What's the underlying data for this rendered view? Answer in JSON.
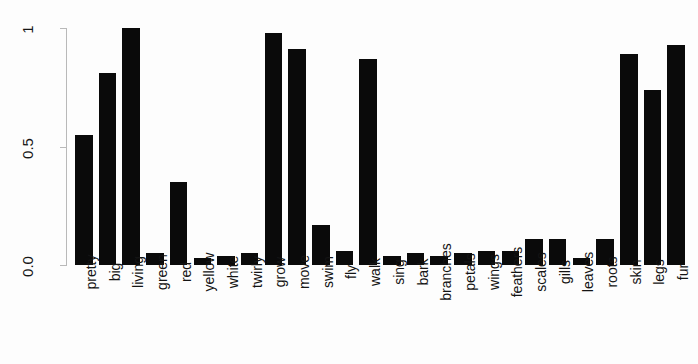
{
  "chart_data": {
    "type": "bar",
    "title": "",
    "xlabel": "",
    "ylabel": "",
    "ylim": [
      0,
      1
    ],
    "grid": false,
    "legend": null,
    "bar_color": "#0a0a0a",
    "axis_color": "#b9b9b9",
    "background": "#fdfdfd",
    "ytick_labels": [
      "0.0",
      "0.5",
      "1"
    ],
    "ytick_values": [
      0,
      0.5,
      1
    ],
    "categories": [
      "pretty",
      "big",
      "living",
      "green",
      "red",
      "yellow",
      "white",
      "twirly",
      "grow",
      "move",
      "swim",
      "fly",
      "walk",
      "sing",
      "bark",
      "branches",
      "petals",
      "wings",
      "feathers",
      "scales",
      "gills",
      "leaves",
      "roots",
      "skin",
      "legs",
      "fur"
    ],
    "values": [
      0.55,
      0.81,
      1.0,
      0.05,
      0.35,
      0.03,
      0.04,
      0.05,
      0.98,
      0.91,
      0.17,
      0.06,
      0.87,
      0.04,
      0.05,
      0.04,
      0.05,
      0.06,
      0.06,
      0.11,
      0.11,
      0.03,
      0.11,
      0.89,
      0.74,
      0.93
    ]
  }
}
